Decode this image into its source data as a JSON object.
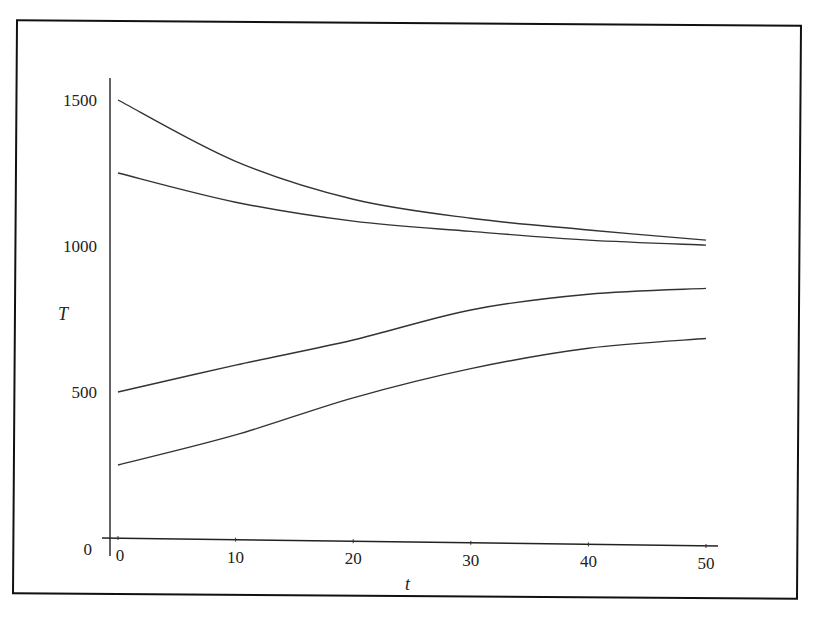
{
  "chart_data": {
    "type": "line",
    "title": "",
    "xlabel": "t",
    "ylabel": "T",
    "xlim": [
      0,
      50
    ],
    "ylim": [
      0,
      1500
    ],
    "x_ticks": [
      "0",
      "10",
      "20",
      "30",
      "40",
      "50"
    ],
    "x_tick_values": [
      0,
      10,
      20,
      30,
      40,
      50
    ],
    "y_ticks": [
      "0",
      "500",
      "1000",
      "1500"
    ],
    "y_tick_values": [
      0,
      500,
      1000,
      1500
    ],
    "grid": false,
    "legend": null,
    "x": [
      0,
      10,
      20,
      30,
      40,
      50
    ],
    "series": [
      {
        "name": "T0=1500",
        "values": [
          1500,
          1290,
          1160,
          1095,
          1055,
          1020
        ]
      },
      {
        "name": "T0=1250",
        "values": [
          1250,
          1150,
          1085,
          1050,
          1020,
          1003
        ]
      },
      {
        "name": "T0=500",
        "values": [
          500,
          592,
          678,
          781,
          835,
          855
        ]
      },
      {
        "name": "T0=250",
        "values": [
          250,
          353,
          480,
          580,
          650,
          683
        ]
      }
    ]
  }
}
